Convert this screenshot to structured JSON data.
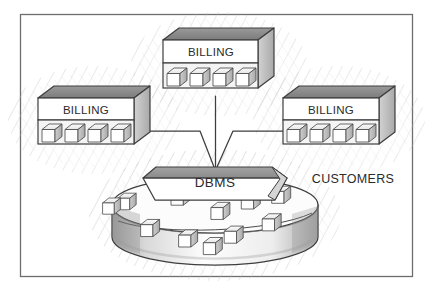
{
  "figure": {
    "kind": "hand-drawn-architecture-diagram",
    "style": "pencil-sketch",
    "frame": {
      "x": 20,
      "y": 14,
      "width": 393,
      "height": 263,
      "stroke": "#6e6e6e"
    },
    "background_color": "#ffffff",
    "ink_color": "#3a3a3a",
    "shade_color": "#8d8d8d",
    "hatch_color": "#b9b9b9"
  },
  "nodes": [
    {
      "id": "billing-top",
      "label": "BILLING",
      "role": "billing-application-building",
      "cube_count": 4,
      "position": {
        "x": 163,
        "y": 28,
        "width": 111,
        "height": 68
      },
      "label_position": {
        "x": 218,
        "y": 52
      }
    },
    {
      "id": "billing-left",
      "label": "BILLING",
      "role": "billing-application-building",
      "cube_count": 4,
      "position": {
        "x": 38,
        "y": 86,
        "width": 112,
        "height": 66
      },
      "label_position": {
        "x": 92,
        "y": 110
      }
    },
    {
      "id": "billing-right",
      "label": "BILLING",
      "role": "billing-application-building",
      "cube_count": 4,
      "position": {
        "x": 283,
        "y": 86,
        "width": 112,
        "height": 66
      },
      "label_position": {
        "x": 338,
        "y": 110
      }
    },
    {
      "id": "dbms",
      "label": "DBMS",
      "role": "database-management-system",
      "shape": "trapezoid-slab",
      "position": {
        "x": 143,
        "y": 158,
        "width": 144,
        "height": 40
      },
      "label_position": {
        "x": 215,
        "y": 182
      }
    },
    {
      "id": "customers",
      "label": "CUSTOMERS",
      "role": "database-cylinder-label",
      "shape": "cylinder",
      "cylinder": {
        "cx": 215,
        "cy": 205,
        "rx": 103,
        "ry": 28,
        "depth": 48
      },
      "label_position": {
        "x": 353,
        "y": 180
      },
      "cube_count": 11
    }
  ],
  "edges": [
    {
      "id": "edge-top-dbms",
      "from": "billing-top",
      "to": "dbms",
      "shape": "vertical-line"
    },
    {
      "id": "edge-left-dbms",
      "from": "billing-left",
      "to": "dbms",
      "shape": "elbow-then-diagonal"
    },
    {
      "id": "edge-right-dbms",
      "from": "billing-right",
      "to": "dbms",
      "shape": "elbow-then-diagonal"
    }
  ],
  "cubes_in_cylinder": [
    {
      "x": 132,
      "y": 208
    },
    {
      "x": 186,
      "y": 200
    },
    {
      "x": 228,
      "y": 213
    },
    {
      "x": 258,
      "y": 203
    },
    {
      "x": 292,
      "y": 199
    },
    {
      "x": 156,
      "y": 231
    },
    {
      "x": 196,
      "y": 242
    },
    {
      "x": 243,
      "y": 237
    },
    {
      "x": 283,
      "y": 228
    },
    {
      "x": 168,
      "y": 247
    },
    {
      "x": 118,
      "y": 220
    }
  ],
  "labels": {
    "billing": "BILLING",
    "dbms": "DBMS",
    "customers": "CUSTOMERS"
  }
}
